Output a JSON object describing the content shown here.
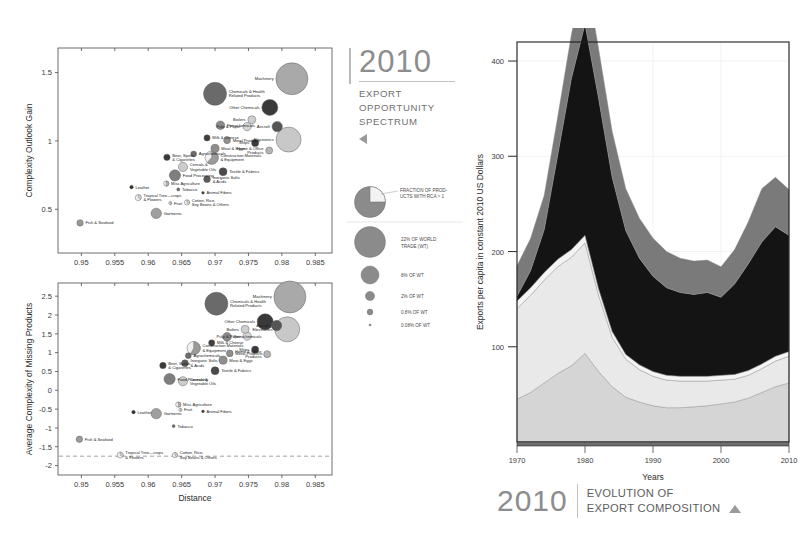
{
  "caption_top": {
    "year": "2010",
    "line1": "EXPORT",
    "line2": "OPPORTUNITY",
    "line3": "SPECTRUM"
  },
  "caption_bottom": {
    "year": "2010",
    "line1": "EVOLUTION OF",
    "line2": "EXPORT COMPOSITION"
  },
  "legend": {
    "pie_note_l1": "FRACTION OF PROD-",
    "pie_note_l2": "UCTS WITH RCA > 1",
    "sizes": [
      {
        "label_l1": "22% OF WORLD",
        "label_l2": "TRADE (WT)",
        "r": 15.5
      },
      {
        "label_l1": "8% OF WT",
        "label_l2": "",
        "r": 9.0
      },
      {
        "label_l1": "2% OF WT",
        "label_l2": "",
        "r": 4.6
      },
      {
        "label_l1": "0.8% OF WT",
        "label_l2": "",
        "r": 2.9
      },
      {
        "label_l1": "0.08% OF WT",
        "label_l2": "",
        "r": 1.1
      }
    ]
  },
  "chart_data": [
    {
      "type": "scatter",
      "name": "complexity-outlook-gain",
      "title": "",
      "xlabel": "",
      "ylabel": "Complexity Outlook Gain",
      "xticks": [
        "0.95",
        "0.955",
        "0.96",
        "0.965",
        "0.97",
        "0.975",
        "0.98",
        "0.985"
      ],
      "xtickvals": [
        0.95,
        0.955,
        0.96,
        0.965,
        0.97,
        0.975,
        0.98,
        0.985
      ],
      "yticks": [
        "0.5",
        "1",
        "1.5"
      ],
      "ytickvals": [
        0.5,
        1,
        1.5
      ],
      "xlim": [
        0.9465,
        0.9875
      ],
      "ylim": [
        0.18,
        1.68
      ],
      "grid": false,
      "points": [
        {
          "label": "Machinery",
          "x": 0.9815,
          "y": 1.455,
          "r": 16.0,
          "shade": "#a9a9a9",
          "frac": 1.0
        },
        {
          "label": "Chemicals & Health\nRelated Products",
          "x": 0.97,
          "y": 1.345,
          "r": 11.5,
          "shade": "#6a6a6a",
          "frac": 1.0
        },
        {
          "label": "Other Chemicals",
          "x": 0.9782,
          "y": 1.245,
          "r": 8.0,
          "shade": "#3a3a3a",
          "frac": 1.0
        },
        {
          "label": "Aircraft",
          "x": 0.9793,
          "y": 1.105,
          "r": 5.2,
          "shade": "#555555",
          "frac": 1.0
        },
        {
          "label": "Electronics",
          "x": 0.981,
          "y": 1.01,
          "r": 12.5,
          "shade": "#c8c8c8",
          "frac": 1.0
        },
        {
          "label": "Boilers",
          "x": 0.9755,
          "y": 1.155,
          "r": 4.0,
          "shade": "#cfcfcf",
          "frac": 1.0
        },
        {
          "label": "Pulp & Paper",
          "x": 0.9748,
          "y": 1.105,
          "r": 4.2,
          "shade": "#d6d6d6",
          "frac": 1.0
        },
        {
          "label": "Petrochemicals",
          "x": 0.9708,
          "y": 1.115,
          "r": 4.3,
          "shade": "#8a8a8a",
          "frac": 1.0
        },
        {
          "label": "Milk & Cheese",
          "x": 0.9688,
          "y": 1.022,
          "r": 3.1,
          "shade": "#3f3f3f",
          "frac": 1.0
        },
        {
          "label": "Metal Products",
          "x": 0.9718,
          "y": 1.005,
          "r": 3.4,
          "shade": "#8f8f8f",
          "frac": 1.0
        },
        {
          "label": "Ships",
          "x": 0.976,
          "y": 0.985,
          "r": 3.6,
          "shade": "#3a3a3a",
          "frac": 1.0
        },
        {
          "label": "Home & Office\nProducts",
          "x": 0.9781,
          "y": 0.93,
          "r": 3.5,
          "shade": "#b5b5b5",
          "frac": 1.0
        },
        {
          "label": "Meat & Eggs",
          "x": 0.97,
          "y": 0.945,
          "r": 4.1,
          "shade": "#8e8e8e",
          "frac": 1.0
        },
        {
          "label": "Construction Materials\n& Equipment",
          "x": 0.9695,
          "y": 0.878,
          "r": 6.6,
          "shade": "#9a9a9a",
          "frac": 0.62
        },
        {
          "label": "Agrochemicals",
          "x": 0.9668,
          "y": 0.905,
          "r": 3.0,
          "shade": "#6b6b6b",
          "frac": 1.0
        },
        {
          "label": "Beer, Spirits\n& Cigarettes",
          "x": 0.9628,
          "y": 0.88,
          "r": 3.2,
          "shade": "#3a3a3a",
          "frac": 1.0
        },
        {
          "label": "Cereals &\nVegetable Oils",
          "x": 0.9652,
          "y": 0.81,
          "r": 4.6,
          "shade": "#cccccc",
          "frac": 1.0
        },
        {
          "label": "Textile & Fabrics",
          "x": 0.9712,
          "y": 0.775,
          "r": 4.0,
          "shade": "#4a4a4a",
          "frac": 1.0
        },
        {
          "label": "Food Processing",
          "x": 0.964,
          "y": 0.748,
          "r": 5.6,
          "shade": "#7e7e7e",
          "frac": 1.0
        },
        {
          "label": "Inorganic Salts\n& Acids",
          "x": 0.9688,
          "y": 0.72,
          "r": 3.4,
          "shade": "#5a5a5a",
          "frac": 1.0
        },
        {
          "label": "Misc Agriculture",
          "x": 0.9627,
          "y": 0.688,
          "r": 2.6,
          "shade": "#b0b0b0",
          "frac": 0.5
        },
        {
          "label": "Tobacco",
          "x": 0.9645,
          "y": 0.645,
          "r": 1.6,
          "shade": "#6a6a6a",
          "frac": 1.0
        },
        {
          "label": "Leather",
          "x": 0.9575,
          "y": 0.662,
          "r": 1.8,
          "shade": "#2f2f2f",
          "frac": 1.0
        },
        {
          "label": "Animal Fibers",
          "x": 0.9682,
          "y": 0.62,
          "r": 1.4,
          "shade": "#3a3a3a",
          "frac": 1.0
        },
        {
          "label": "Tropical Tree—crops\n& Flowers",
          "x": 0.9585,
          "y": 0.585,
          "r": 3.0,
          "shade": "#d2d2d2",
          "frac": 0.35
        },
        {
          "label": "Fruit",
          "x": 0.9633,
          "y": 0.545,
          "r": 1.5,
          "shade": "#d8d8d8",
          "frac": 0.5
        },
        {
          "label": "Cotton, Rice,\nSoy Beans & Others",
          "x": 0.9658,
          "y": 0.55,
          "r": 2.6,
          "shade": "#d0d0d0",
          "frac": 0.4
        },
        {
          "label": "Garments",
          "x": 0.9612,
          "y": 0.47,
          "r": 5.2,
          "shade": "#9f9f9f",
          "frac": 1.0
        },
        {
          "label": "Fish & Seafood",
          "x": 0.9498,
          "y": 0.4,
          "r": 3.2,
          "shade": "#9a9a9a",
          "frac": 1.0
        }
      ]
    },
    {
      "type": "scatter",
      "name": "average-complexity-of-missing-products",
      "title": "",
      "xlabel": "Distance",
      "ylabel": "Average Complexity of Missing Products",
      "xticks": [
        "0.95",
        "0.955",
        "0.96",
        "0.965",
        "0.97",
        "0.975",
        "0.98",
        "0.985"
      ],
      "xtickvals": [
        0.95,
        0.955,
        0.96,
        0.965,
        0.97,
        0.975,
        0.98,
        0.985
      ],
      "yticks": [
        "2.5",
        "2",
        "1.5",
        "1",
        "0.5",
        "0",
        "-0.5",
        "-1",
        "-1.5",
        "-2"
      ],
      "ytickvals": [
        2.5,
        2,
        1.5,
        1,
        0.5,
        0,
        -0.5,
        -1,
        -1.5,
        -2
      ],
      "xlim": [
        0.9465,
        0.9875
      ],
      "ylim": [
        -2.25,
        2.85
      ],
      "grid": false,
      "reference_line": {
        "y": -1.75,
        "style": "dashed"
      },
      "points": [
        {
          "label": "Machinery",
          "x": 0.9812,
          "y": 2.48,
          "r": 16.0,
          "shade": "#a9a9a9",
          "frac": 1.0
        },
        {
          "label": "Chemicals & Health\nRelated Products",
          "x": 0.9702,
          "y": 2.3,
          "r": 11.5,
          "shade": "#6a6a6a",
          "frac": 1.0
        },
        {
          "label": "Other Chemicals",
          "x": 0.9775,
          "y": 1.82,
          "r": 8.0,
          "shade": "#3a3a3a",
          "frac": 1.0
        },
        {
          "label": "Electronics",
          "x": 0.9808,
          "y": 1.62,
          "r": 12.5,
          "shade": "#c8c8c8",
          "frac": 1.0
        },
        {
          "label": "Aircraft",
          "x": 0.9792,
          "y": 1.72,
          "r": 5.2,
          "shade": "#555555",
          "frac": 1.0
        },
        {
          "label": "Boilers",
          "x": 0.9745,
          "y": 1.62,
          "r": 4.0,
          "shade": "#cfcfcf",
          "frac": 1.0
        },
        {
          "label": "Pulp & Paper",
          "x": 0.9748,
          "y": 1.44,
          "r": 4.2,
          "shade": "#d6d6d6",
          "frac": 1.0
        },
        {
          "label": "Petrochemicals",
          "x": 0.9718,
          "y": 1.42,
          "r": 4.3,
          "shade": "#8a8a8a",
          "frac": 1.0
        },
        {
          "label": "Milk & Cheese",
          "x": 0.9695,
          "y": 1.26,
          "r": 3.1,
          "shade": "#3f3f3f",
          "frac": 1.0
        },
        {
          "label": "Construction Materials\n& Equipment",
          "x": 0.9668,
          "y": 1.12,
          "r": 6.6,
          "shade": "#9a9a9a",
          "frac": 0.58
        },
        {
          "label": "Metal Products",
          "x": 0.9722,
          "y": 0.98,
          "r": 3.4,
          "shade": "#8f8f8f",
          "frac": 1.0
        },
        {
          "label": "Ships",
          "x": 0.976,
          "y": 1.08,
          "r": 3.6,
          "shade": "#3a3a3a",
          "frac": 1.0
        },
        {
          "label": "Home & Office\nProducts",
          "x": 0.9778,
          "y": 0.96,
          "r": 3.5,
          "shade": "#b5b5b5",
          "frac": 1.0
        },
        {
          "label": "Agrochemicals",
          "x": 0.966,
          "y": 0.92,
          "r": 3.0,
          "shade": "#6b6b6b",
          "frac": 1.0
        },
        {
          "label": "Meat & Eggs",
          "x": 0.9712,
          "y": 0.8,
          "r": 4.1,
          "shade": "#8e8e8e",
          "frac": 1.0
        },
        {
          "label": "Beer, Spirits\n& Cigarettes",
          "x": 0.9622,
          "y": 0.66,
          "r": 3.2,
          "shade": "#3a3a3a",
          "frac": 1.0
        },
        {
          "label": "Inorganic Salts\n& Acids",
          "x": 0.9655,
          "y": 0.72,
          "r": 3.4,
          "shade": "#5a5a5a",
          "frac": 1.0
        },
        {
          "label": "Textile & Fabrics",
          "x": 0.97,
          "y": 0.52,
          "r": 4.0,
          "shade": "#4a4a4a",
          "frac": 1.0
        },
        {
          "label": "Food Processing",
          "x": 0.9632,
          "y": 0.3,
          "r": 5.6,
          "shade": "#7e7e7e",
          "frac": 1.0
        },
        {
          "label": "Cereals &\nVegetable Oils",
          "x": 0.9652,
          "y": 0.24,
          "r": 4.6,
          "shade": "#cccccc",
          "frac": 1.0
        },
        {
          "label": "Misc Agriculture",
          "x": 0.9645,
          "y": -0.38,
          "r": 2.6,
          "shade": "#b0b0b0",
          "frac": 0.5
        },
        {
          "label": "Fruit",
          "x": 0.9648,
          "y": -0.52,
          "r": 1.5,
          "shade": "#d8d8d8",
          "frac": 0.5
        },
        {
          "label": "Animal Fibers",
          "x": 0.9682,
          "y": -0.56,
          "r": 1.4,
          "shade": "#3a3a3a",
          "frac": 1.0
        },
        {
          "label": "Leather",
          "x": 0.9578,
          "y": -0.58,
          "r": 1.8,
          "shade": "#2f2f2f",
          "frac": 1.0
        },
        {
          "label": "Garments",
          "x": 0.9612,
          "y": -0.62,
          "r": 5.2,
          "shade": "#9f9f9f",
          "frac": 1.0
        },
        {
          "label": "Tobacco",
          "x": 0.9638,
          "y": -0.95,
          "r": 1.6,
          "shade": "#6a6a6a",
          "frac": 1.0
        },
        {
          "label": "Fish & Seafood",
          "x": 0.9497,
          "y": -1.3,
          "r": 3.2,
          "shade": "#9a9a9a",
          "frac": 1.0
        },
        {
          "label": "Tropical Tree—crops\n& Flowers",
          "x": 0.9558,
          "y": -1.72,
          "r": 3.0,
          "shade": "#d2d2d2",
          "frac": 0.35
        },
        {
          "label": "Cotton, Rice,\nSoy Beans & Others",
          "x": 0.964,
          "y": -1.72,
          "r": 2.6,
          "shade": "#d0d0d0",
          "frac": 0.4
        }
      ]
    },
    {
      "type": "area",
      "name": "evolution-of-export-composition",
      "title": "",
      "xlabel": "Years",
      "ylabel": "Exports per capita in constant 2010 US Dollars",
      "xticks": [
        "1970",
        "1980",
        "1990",
        "2000",
        "2010"
      ],
      "xtickvals": [
        1970,
        1980,
        1990,
        2000,
        2010
      ],
      "yticks": [
        "100",
        "200",
        "300",
        "400"
      ],
      "ytickvals": [
        100,
        200,
        300,
        400
      ],
      "xlim": [
        1970,
        2010
      ],
      "ylim": [
        0,
        420
      ],
      "grid": true,
      "stacked": true,
      "x": [
        1970,
        1972,
        1974,
        1976,
        1978,
        1980,
        1982,
        1984,
        1986,
        1988,
        1990,
        1992,
        1994,
        1996,
        1998,
        2000,
        2002,
        2004,
        2006,
        2008,
        2010
      ],
      "series": [
        {
          "name": "band-1-light",
          "color": "#d5d5d5",
          "values": [
            45,
            52,
            62,
            72,
            80,
            93,
            74,
            58,
            47,
            42,
            38,
            36,
            36,
            37,
            38,
            40,
            42,
            46,
            52,
            58,
            62
          ]
        },
        {
          "name": "band-2-pale",
          "color": "#e9e9e9",
          "values": [
            95,
            102,
            108,
            112,
            114,
            116,
            80,
            52,
            40,
            34,
            31,
            29,
            28,
            27,
            26,
            25,
            24,
            24,
            25,
            27,
            28
          ]
        },
        {
          "name": "band-3-line",
          "color": "#f4f4f4",
          "values": [
            8,
            8,
            8,
            8,
            8,
            8,
            7,
            6,
            5,
            5,
            5,
            5,
            5,
            5,
            5,
            5,
            5,
            5,
            5,
            5,
            5
          ]
        },
        {
          "name": "band-4-dark",
          "color": "#141414",
          "values": [
            5,
            18,
            45,
            110,
            180,
            222,
            200,
            162,
            130,
            112,
            100,
            92,
            88,
            86,
            88,
            82,
            95,
            112,
            128,
            136,
            122
          ]
        },
        {
          "name": "band-5-gray",
          "color": "#7a7a7a",
          "values": [
            32,
            34,
            36,
            40,
            46,
            58,
            52,
            48,
            44,
            42,
            40,
            38,
            36,
            35,
            34,
            32,
            36,
            44,
            56,
            52,
            48
          ]
        }
      ]
    }
  ]
}
